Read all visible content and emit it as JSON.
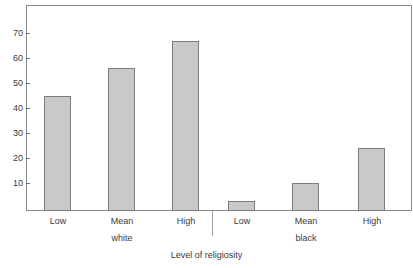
{
  "chart_data": {
    "type": "bar",
    "title": "",
    "subtitle": "",
    "xlabel": "Level of religiosity",
    "ylabel": "",
    "categories": [
      "Low",
      "Mean",
      "High",
      "Low",
      "Mean",
      "High"
    ],
    "groups": [
      {
        "name": "white",
        "categories": [
          "Low",
          "Mean",
          "High"
        ],
        "values": [
          46,
          57,
          68
        ]
      },
      {
        "name": "black",
        "categories": [
          "Low",
          "Mean",
          "High"
        ],
        "values": [
          4,
          11,
          25
        ]
      }
    ],
    "values": [
      46,
      57,
      68,
      4,
      11,
      25
    ],
    "ylim": [
      0,
      78
    ],
    "yticks": [
      10,
      20,
      30,
      40,
      50,
      60,
      70
    ],
    "ytick_labels": [
      "10",
      "20",
      "30",
      "40",
      "50",
      "60",
      "70"
    ],
    "grid": false,
    "legend": "none",
    "bar_color": "#c9c9c9",
    "bar_border_color": "#7d7d7d",
    "frame_color": "#8a8a8a",
    "text_color": "#3b3b3b"
  },
  "axes": {
    "y_tick_labels": [
      "70",
      "60",
      "50",
      "40",
      "30",
      "20",
      "10"
    ],
    "x_category_labels": [
      "Low",
      "Mean",
      "High",
      "Low",
      "Mean",
      "High"
    ],
    "x_group_labels": [
      "white",
      "black"
    ],
    "x_axis_title": "Level of religiosity"
  },
  "bars": [
    {
      "label": "Low",
      "group": "white",
      "value": 46
    },
    {
      "label": "Mean",
      "group": "white",
      "value": 57
    },
    {
      "label": "High",
      "group": "white",
      "value": 68
    },
    {
      "label": "Low",
      "group": "black",
      "value": 4
    },
    {
      "label": "Mean",
      "group": "black",
      "value": 11
    },
    {
      "label": "High",
      "group": "black",
      "value": 25
    }
  ]
}
